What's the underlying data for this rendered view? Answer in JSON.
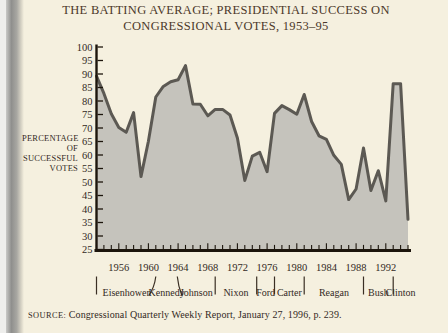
{
  "page": {
    "title_line1": "THE BATTING AVERAGE; PRESIDENTIAL SUCCESS ON",
    "title_line2": "CONGRESSIONAL VOTES, 1953–95",
    "source_label": "SOURCE:",
    "source_text": " Congressional Quarterly Weekly Report, January 27, 1996, p. 239."
  },
  "chart_data": {
    "type": "area",
    "title": "The Batting Average; Presidential Success on Congressional Votes, 1953–95",
    "ylabel_lines": [
      "PERCENTAGE",
      "OF",
      "SUCCESSFUL",
      "VOTES"
    ],
    "xlim": [
      1953,
      1995
    ],
    "ylim": [
      25,
      100
    ],
    "y_ticks": [
      100,
      95,
      90,
      85,
      80,
      75,
      70,
      65,
      60,
      55,
      50,
      45,
      40,
      35,
      30,
      25
    ],
    "x_tick_labels": [
      1956,
      1960,
      1964,
      1968,
      1972,
      1976,
      1980,
      1984,
      1988,
      1992
    ],
    "years": [
      1953,
      1954,
      1955,
      1956,
      1957,
      1958,
      1959,
      1960,
      1961,
      1962,
      1963,
      1964,
      1965,
      1966,
      1967,
      1968,
      1969,
      1970,
      1971,
      1972,
      1973,
      1974,
      1975,
      1976,
      1977,
      1978,
      1979,
      1980,
      1981,
      1982,
      1983,
      1984,
      1985,
      1986,
      1987,
      1988,
      1989,
      1990,
      1991,
      1992,
      1993,
      1994,
      1995
    ],
    "values": [
      89.2,
      82.8,
      75.3,
      70.2,
      68.4,
      75.7,
      52.0,
      65.1,
      81.5,
      85.4,
      87.1,
      87.9,
      93.1,
      78.9,
      78.8,
      74.5,
      76.9,
      76.9,
      74.8,
      66.3,
      50.6,
      59.6,
      61.0,
      53.8,
      75.4,
      78.3,
      76.8,
      75.1,
      82.4,
      72.4,
      67.1,
      65.8,
      59.9,
      56.5,
      43.5,
      47.4,
      62.6,
      46.8,
      54.2,
      43.0,
      86.4,
      86.4,
      36.2
    ],
    "presidents": [
      {
        "name": "Eisenhower",
        "start": 1953,
        "end": 1961,
        "divider_curve": "none"
      },
      {
        "name": "Kennedy",
        "start": 1961,
        "end": 1963.9,
        "divider_curve": "left"
      },
      {
        "name": "Johnson",
        "start": 1963.9,
        "end": 1969,
        "divider_curve": "right"
      },
      {
        "name": "Nixon",
        "start": 1969,
        "end": 1974.6,
        "divider_curve": "none"
      },
      {
        "name": "Ford",
        "start": 1974.6,
        "end": 1977,
        "divider_curve": "none"
      },
      {
        "name": "Carter",
        "start": 1977,
        "end": 1981,
        "divider_curve": "none"
      },
      {
        "name": "Reagan",
        "start": 1981,
        "end": 1989,
        "divider_curve": "none"
      },
      {
        "name": "Bush",
        "start": 1989,
        "end": 1993,
        "divider_curve": "none"
      },
      {
        "name": "Clinton",
        "start": 1993,
        "end": 1995,
        "divider_curve": "none"
      }
    ],
    "legend": "none",
    "grid": "off",
    "colors": {
      "area_fill": "#c5c3bc",
      "line": "#5c5953",
      "axis": "#1c150c",
      "text": "#33291e",
      "divider": "#3a2f24",
      "background": "#f5f0df"
    }
  }
}
